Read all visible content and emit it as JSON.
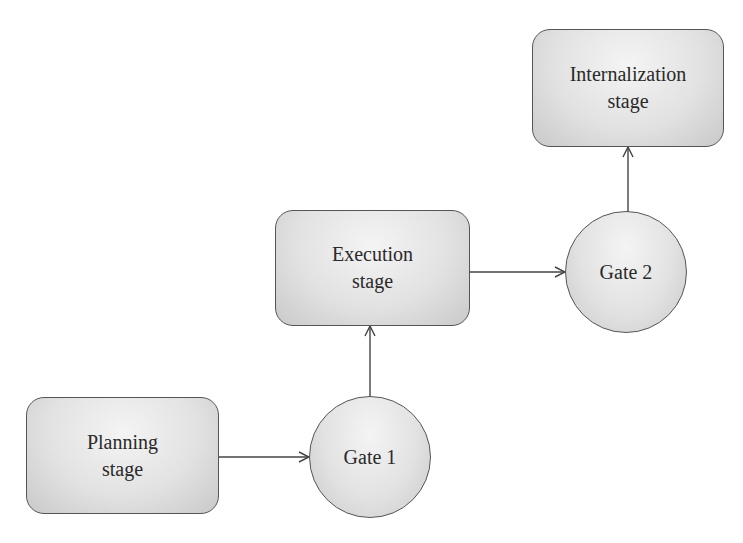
{
  "diagram": {
    "type": "flowchart",
    "stages": [
      {
        "id": "planning",
        "line1": "Planning",
        "line2": "stage"
      },
      {
        "id": "execution",
        "line1": "Execution",
        "line2": "stage"
      },
      {
        "id": "internalization",
        "line1": "Internalization",
        "line2": "stage"
      }
    ],
    "gates": [
      {
        "id": "gate1",
        "label": "Gate 1"
      },
      {
        "id": "gate2",
        "label": "Gate 2"
      }
    ],
    "edges": [
      {
        "from": "planning",
        "to": "gate1"
      },
      {
        "from": "gate1",
        "to": "execution"
      },
      {
        "from": "execution",
        "to": "gate2"
      },
      {
        "from": "gate2",
        "to": "internalization"
      }
    ],
    "colors": {
      "stroke": "#555555",
      "fill_light": "#f4f4f4",
      "fill_dark": "#c9c9c9",
      "text": "#2a2a2a",
      "background": "#ffffff"
    }
  }
}
